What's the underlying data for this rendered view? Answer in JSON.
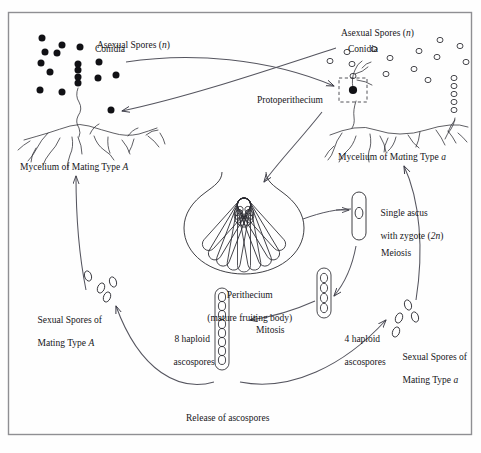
{
  "figure": {
    "title_visible": false,
    "border_color": "#8a8a8a",
    "ink_color": "#1a1a1a",
    "background": "#fefefe"
  },
  "labels": {
    "asexual_spores_left": "Asexual Spores (n)",
    "conidia_left": "Conidia",
    "asexual_spores_right": "Asexual Spores (n)",
    "conidia_right": "Conidia",
    "mycelium_A": "Mycelium of Mating Type A",
    "mycelium_a": "Mycelium of Mating Type a",
    "protoperithecium": "Protoperithecium",
    "perithecium_line1": "Perithecium",
    "perithecium_line2": "(mature fruiting body)",
    "single_ascus_line1": "Single ascus",
    "single_ascus_line2": "with zygote (2n)",
    "meiosis": "Meiosis",
    "mitosis": "Mitosis",
    "four_haploid_line1": "4 haploid",
    "four_haploid_line2": "ascospores",
    "eight_haploid_line1": "8 haploid",
    "eight_haploid_line2": "ascospores",
    "sexual_spores_A_line1": "Sexual Spores of",
    "sexual_spores_A_line2": "Mating Type A",
    "sexual_spores_a_line1": "Sexual Spores of",
    "sexual_spores_a_line2": "Mating Type a",
    "release": "Release of ascospores"
  },
  "counts": {
    "conidia_filled_left": 17,
    "conidia_open_right": 14,
    "asci_in_perithecium": 9,
    "ascospores_four": 4,
    "ascospores_eight": 8,
    "sexual_spores_A": 4,
    "sexual_spores_a": 4
  },
  "conidia_left_points": [
    [
      42,
      38
    ],
    [
      62,
      45
    ],
    [
      80,
      47
    ],
    [
      45,
      52
    ],
    [
      57,
      53
    ],
    [
      41,
      63
    ],
    [
      50,
      72
    ],
    [
      78,
      70
    ],
    [
      78,
      64
    ],
    [
      78,
      77
    ],
    [
      78,
      83
    ],
    [
      99,
      62
    ],
    [
      98,
      78
    ],
    [
      116,
      75
    ],
    [
      40,
      90
    ],
    [
      62,
      92
    ],
    [
      111,
      110
    ]
  ],
  "conidia_right_points": [
    [
      330,
      61
    ],
    [
      347,
      52
    ],
    [
      352,
      64
    ],
    [
      374,
      49
    ],
    [
      390,
      58
    ],
    [
      419,
      51
    ],
    [
      437,
      57
    ],
    [
      353,
      76
    ],
    [
      386,
      74
    ],
    [
      414,
      69
    ],
    [
      428,
      80
    ],
    [
      440,
      40
    ],
    [
      460,
      46
    ],
    [
      466,
      62
    ]
  ],
  "ascus_chain_right": [
    [
      454,
      78
    ],
    [
      454,
      86
    ],
    [
      454,
      94
    ],
    [
      454,
      102
    ],
    [
      454,
      110
    ]
  ],
  "sexual_spores_A_points": [
    [
      88,
      276
    ],
    [
      101,
      288
    ],
    [
      113,
      282
    ],
    [
      107,
      297
    ]
  ],
  "sexual_spores_a_points": [
    [
      408,
      305
    ],
    [
      399,
      318
    ],
    [
      415,
      317
    ],
    [
      396,
      332
    ]
  ],
  "geometry": {
    "frame": {
      "x": 8,
      "y": 12,
      "w": 464,
      "h": 423
    },
    "protoperithecium_box": {
      "x": 339,
      "y": 78,
      "w": 28,
      "h": 24
    },
    "perithecium_center": [
      244,
      218
    ],
    "single_ascus": {
      "x": 352,
      "y": 192,
      "w": 14,
      "h": 48
    },
    "ascus_four": {
      "x": 317,
      "y": 268,
      "w": 14,
      "h": 50
    },
    "ascus_eight": {
      "x": 215,
      "y": 288,
      "w": 14,
      "h": 82
    }
  }
}
